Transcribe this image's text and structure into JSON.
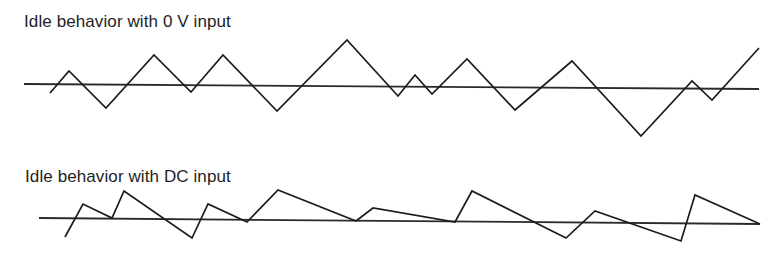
{
  "diagram": {
    "panels": [
      {
        "id": "zero-volt",
        "title": "Idle behavior with 0 V input",
        "baseline": {
          "x1": 24,
          "y1": 84,
          "x2": 759,
          "y2": 89
        },
        "waveform_points": [
          [
            50,
            93
          ],
          [
            69,
            71
          ],
          [
            106,
            108
          ],
          [
            154,
            55
          ],
          [
            191,
            92
          ],
          [
            223,
            55
          ],
          [
            277,
            111
          ],
          [
            347,
            40
          ],
          [
            398,
            96
          ],
          [
            415,
            75
          ],
          [
            432,
            94
          ],
          [
            467,
            59
          ],
          [
            515,
            110
          ],
          [
            572,
            61
          ],
          [
            641,
            136
          ],
          [
            692,
            81
          ],
          [
            712,
            100
          ],
          [
            759,
            48
          ]
        ]
      },
      {
        "id": "dc",
        "title": "Idle behavior with DC input",
        "baseline": {
          "x1": 39,
          "y1": 218,
          "x2": 760,
          "y2": 224
        },
        "waveform_points": [
          [
            65,
            237
          ],
          [
            83,
            204
          ],
          [
            112,
            218
          ],
          [
            124,
            191
          ],
          [
            192,
            238
          ],
          [
            208,
            204
          ],
          [
            247,
            222
          ],
          [
            278,
            190
          ],
          [
            356,
            221
          ],
          [
            373,
            208
          ],
          [
            455,
            222
          ],
          [
            472,
            191
          ],
          [
            566,
            238
          ],
          [
            595,
            211
          ],
          [
            681,
            241
          ],
          [
            695,
            195
          ],
          [
            760,
            224
          ]
        ]
      }
    ],
    "colors": {
      "background": "#ffffff",
      "line": "#1c1c1c",
      "text": "#1e1e1e"
    }
  }
}
